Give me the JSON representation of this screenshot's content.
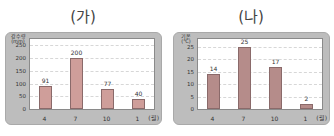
{
  "chart_data": [
    {
      "type": "bar",
      "title": "(가)",
      "xlabel": "(월)",
      "ylabel": "강수량 (mm)",
      "categories": [
        "4",
        "7",
        "10",
        "1"
      ],
      "values": [
        91,
        200,
        77,
        40
      ],
      "yticks": [
        0,
        50,
        100,
        150,
        200,
        250
      ],
      "ylim": [
        0,
        275
      ],
      "grid": true,
      "bar_color": "#cf9e9a"
    },
    {
      "type": "bar",
      "title": "(나)",
      "xlabel": "(월)",
      "ylabel": "기온 (℃)",
      "categories": [
        "4",
        "7",
        "10",
        "1"
      ],
      "values": [
        14,
        25,
        17,
        2
      ],
      "yticks": [
        0,
        5,
        10,
        15,
        20,
        25
      ],
      "ylim": [
        0,
        28
      ],
      "grid": true,
      "bar_color": "#b58c8a"
    }
  ],
  "labels": {
    "left_unit_line1": "강수량",
    "left_unit_line2": "(mm)",
    "right_unit_line1": "기온",
    "right_unit_line2": "(℃)"
  }
}
